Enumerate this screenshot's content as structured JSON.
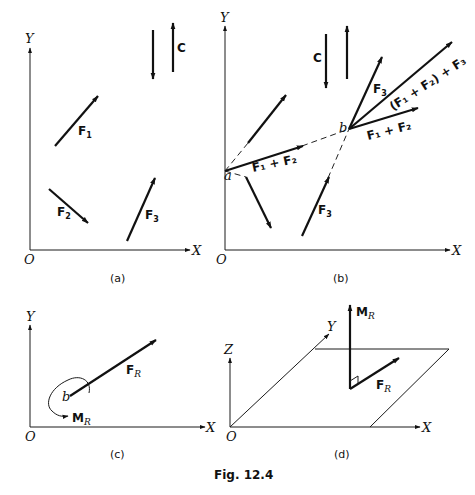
{
  "figure": {
    "caption": "Fig. 12.4",
    "panels": {
      "a": {
        "caption": "(a)",
        "axes": {
          "x": "X",
          "y": "Y",
          "origin": "O"
        },
        "vectors": [
          {
            "label": "F",
            "sub": "1"
          },
          {
            "label": "F",
            "sub": "2"
          },
          {
            "label": "F",
            "sub": "3"
          }
        ],
        "couple": {
          "label": "C"
        }
      },
      "b": {
        "caption": "(b)",
        "axes": {
          "x": "X",
          "y": "Y",
          "origin": "O"
        },
        "points": {
          "a": "a",
          "b": "b"
        },
        "couple": {
          "label": "C"
        },
        "labels": {
          "f1f2_a": "F₁ + F₂",
          "f3_lower": "F",
          "f3_lower_sub": "3",
          "f3_upper": "F",
          "f3_upper_sub": "3",
          "f1f2_b": "F₁ + F₂",
          "resultant": "(F₁ + F₂) + F₃"
        }
      },
      "c": {
        "caption": "(c)",
        "axes": {
          "x": "X",
          "y": "Y",
          "origin": "O"
        },
        "point": "b",
        "force": {
          "label": "F",
          "sub": "R"
        },
        "moment": {
          "label": "M",
          "sub": "R"
        }
      },
      "d": {
        "caption": "(d)",
        "axes": {
          "x": "X",
          "y": "Y",
          "z": "Z",
          "origin": "O"
        },
        "force": {
          "label": "F",
          "sub": "R"
        },
        "moment": {
          "label": "M",
          "sub": "R"
        }
      }
    }
  }
}
